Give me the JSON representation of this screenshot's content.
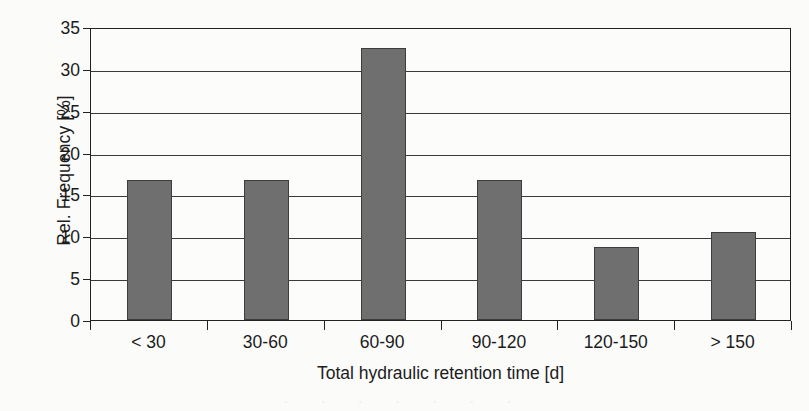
{
  "chart_data": {
    "type": "bar",
    "title": "",
    "xlabel": "Total hydraulic retention time [d]",
    "ylabel": "Rel. Frequency [%]",
    "categories": [
      "< 30",
      "30-60",
      "60-90",
      "90-120",
      "120-150",
      "> 150"
    ],
    "values": [
      16.7,
      16.7,
      32.5,
      16.7,
      8.7,
      10.5
    ],
    "ylim": [
      0,
      35
    ],
    "ytick_values": [
      0,
      5,
      10,
      15,
      20,
      25,
      30,
      35
    ],
    "ytick_labels": [
      "0",
      "5",
      "10",
      "15",
      "20",
      "25",
      "30",
      "35"
    ],
    "grid": "horizontal",
    "legend": "none",
    "bar_color": "#6f6f6f",
    "bar_edge_color": "#3d3d3d",
    "axis_color": "#222222",
    "gridline_color": "#3a3a3a",
    "background_color": "#fbfbfa"
  },
  "artifacts": {
    "bleed_text": "·  ·   ·  ·    ·   ·  ·"
  }
}
